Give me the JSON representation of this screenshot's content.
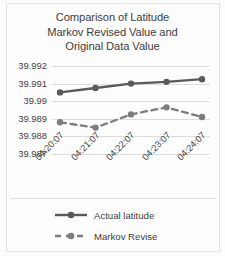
{
  "chart_data": {
    "type": "line",
    "title": "Comparison of Latitude Markov Revised Value and Original Data Value",
    "title_lines": [
      "Comparison of Latitude",
      "Markov Revised Value and",
      "Original Data Value"
    ],
    "xlabel": "",
    "ylabel": "",
    "categories": [
      "04:20:07",
      "04:21:07",
      "04:22:07",
      "04:23:07",
      "04:24:07"
    ],
    "ylim": [
      39.987,
      39.992
    ],
    "ytick_labels": [
      "39.992",
      "39.991",
      "39.99",
      "39.989",
      "39.988",
      "39.987"
    ],
    "ytick_values": [
      39.992,
      39.991,
      39.99,
      39.989,
      39.988,
      39.987
    ],
    "grid": "horizontal",
    "legend_position": "bottom",
    "series": [
      {
        "name": "Actual latitude",
        "values": [
          39.9905,
          39.99075,
          39.991,
          39.9911,
          39.99125
        ],
        "style": "solid",
        "color": "#5a5a5a",
        "marker": "circle"
      },
      {
        "name": "Markov Revise",
        "values": [
          39.9888,
          39.9885,
          39.98925,
          39.98965,
          39.9891
        ],
        "style": "dashed",
        "color": "#7d7d7d",
        "marker": "circle"
      }
    ]
  },
  "colors": {
    "series_actual": "#5a5a5a",
    "series_markov": "#7d7d7d",
    "gridline": "#dcdcdc",
    "text": "#3d3d3d",
    "background": "#fdfdfd"
  }
}
